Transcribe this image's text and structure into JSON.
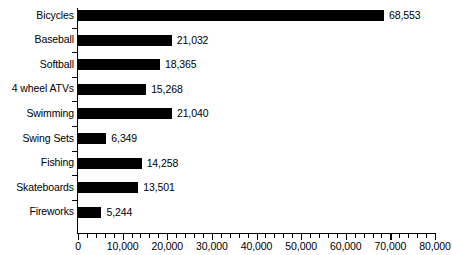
{
  "chart_data": {
    "type": "bar",
    "orientation": "horizontal",
    "title": "",
    "xlabel": "",
    "ylabel": "",
    "xlim": [
      0,
      80000
    ],
    "grid": false,
    "legend": false,
    "bar_color": "#000000",
    "background_color": "#ffffff",
    "axis_color": "#000000",
    "major_tick_interval": 10000,
    "minor_tick_interval": 2000,
    "categories": [
      "Bicycles",
      "Baseball",
      "Softball",
      "4 wheel ATVs",
      "Swimming",
      "Swing Sets",
      "Fishing",
      "Skateboards",
      "Fireworks"
    ],
    "values": [
      68553,
      21032,
      18365,
      15268,
      21040,
      6349,
      14258,
      13501,
      5244
    ],
    "value_labels": [
      "68,553",
      "21,032",
      "18,365",
      "15,268",
      "21,040",
      "6,349",
      "14,258",
      "13,501",
      "5,244"
    ],
    "xticks": [
      0,
      10000,
      20000,
      30000,
      40000,
      50000,
      60000,
      70000,
      80000
    ],
    "xtick_labels": [
      "0",
      "10,000",
      "20,000",
      "30,000",
      "40,000",
      "50,000",
      "60,000",
      "70,000",
      "80,000"
    ]
  }
}
